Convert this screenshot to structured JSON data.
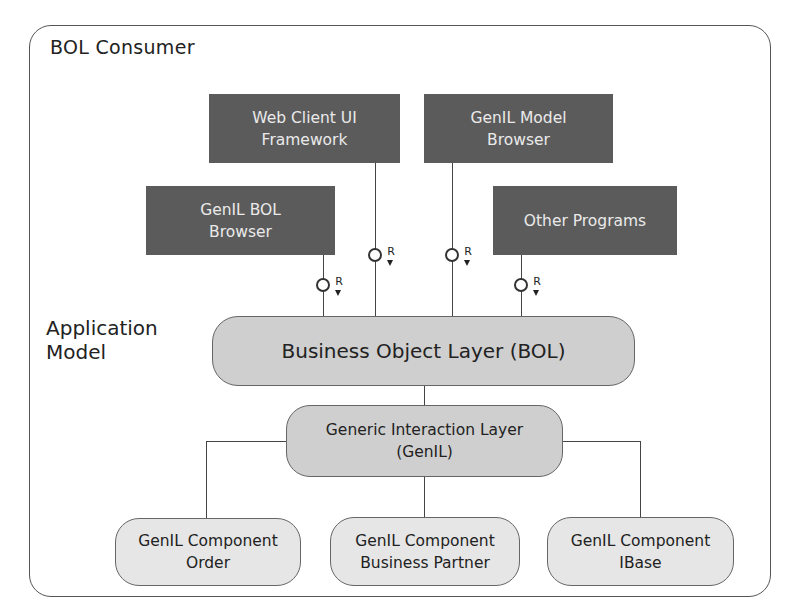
{
  "diagram": {
    "container": {
      "title": "BOL Consumer"
    },
    "side_label": {
      "line1": "Application",
      "line2": "Model"
    },
    "consumers": [
      {
        "id": "web-client",
        "line1": "Web Client UI",
        "line2": "Framework"
      },
      {
        "id": "model-browser",
        "line1": "GenIL Model",
        "line2": "Browser"
      },
      {
        "id": "bol-browser",
        "line1": "GenIL BOL",
        "line2": "Browser"
      },
      {
        "id": "other-programs",
        "line1": "Other Programs"
      }
    ],
    "interface_marker": {
      "label": "R"
    },
    "bol": {
      "label": "Business Object Layer (BOL)"
    },
    "genil": {
      "line1": "Generic Interaction Layer",
      "line2": "(GenIL)"
    },
    "components": [
      {
        "id": "order",
        "line1": "GenIL Component",
        "line2": "Order"
      },
      {
        "id": "business-partner",
        "line1": "GenIL Component",
        "line2": "Business Partner"
      },
      {
        "id": "ibase",
        "line1": "GenIL Component",
        "line2": "IBase"
      }
    ],
    "colors": {
      "dark_box": "#5b5b5b",
      "bol_fill": "#cfcfcf",
      "component_fill": "#e6e6e6",
      "line": "#444444"
    }
  }
}
